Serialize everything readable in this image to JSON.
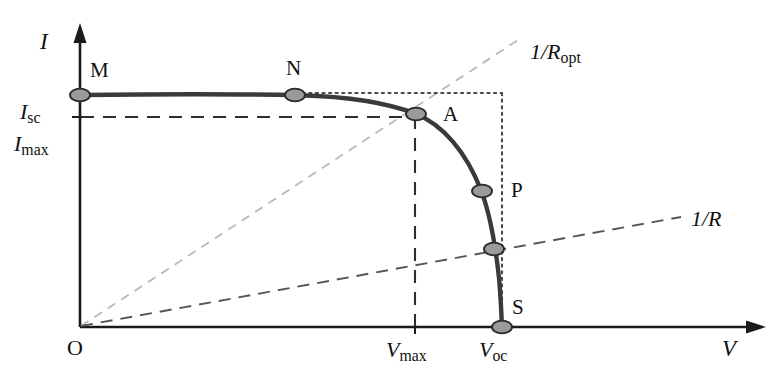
{
  "figure": {
    "kind": "iv-characteristic-curve",
    "background_color": "#ffffff",
    "axes": {
      "y_axis_label": "I",
      "x_axis_label": "V",
      "origin_label": "O"
    },
    "tick_labels": {
      "y_isc_main": "I",
      "y_isc_sub": "sc",
      "y_imax_main": "I",
      "y_imax_sub": "max",
      "x_vmax_main": "V",
      "x_vmax_sub": "max",
      "x_voc_main": "V",
      "x_voc_sub": "oc"
    },
    "curve_points": [
      {
        "name": "M",
        "label": "M",
        "x": 80,
        "y": 95
      },
      {
        "name": "N",
        "label": "N",
        "x": 295,
        "y": 95
      },
      {
        "name": "A",
        "label": "A",
        "x": 415,
        "y": 113
      },
      {
        "name": "P",
        "label": "P",
        "x": 482,
        "y": 191
      },
      {
        "name": "Q",
        "label": "",
        "x": 494,
        "y": 249
      },
      {
        "name": "S",
        "label": "S",
        "x": 502,
        "y": 327
      }
    ],
    "load_lines": [
      {
        "name": "optimal-load-line",
        "label_main": "1/R",
        "label_sub": "opt",
        "style": "dashed-light"
      },
      {
        "name": "load-line",
        "label_main": "1/R",
        "label_sub": "",
        "style": "dashed"
      }
    ],
    "guide_lines": {
      "imax_horizontal": "dashed",
      "vmax_vertical": "dashed",
      "isc_top_horizontal": "dotted",
      "voc_vertical": "dotted"
    },
    "colors": {
      "curve": "#3a3a3a",
      "axis": "#1a1a1a",
      "marker_fill": "#9a9a9a",
      "marker_stroke": "#2b2b2b",
      "dashed": "#555555",
      "dashed_light": "#b9b9b9",
      "dotted": "#4a4a4a",
      "text": "#111111"
    }
  }
}
